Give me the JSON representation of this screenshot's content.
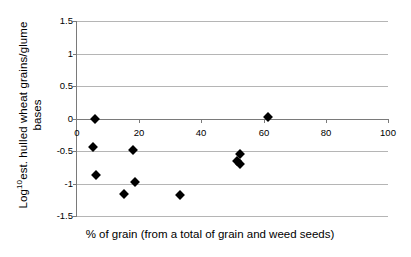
{
  "chart_data": {
    "type": "scatter",
    "title": "",
    "xlabel": "% of grain (from a total of grain and weed seeds)",
    "ylabel_line1": "est. hulled wheat grains/glume",
    "ylabel_line2": "bases",
    "ylabel_prefix": "Log",
    "ylabel_superscript": "10",
    "xlim": [
      0,
      100
    ],
    "ylim": [
      -1.5,
      1.5
    ],
    "xticks": [
      0,
      20,
      40,
      60,
      80,
      100
    ],
    "xtick_labels": [
      "0",
      "20",
      "40",
      "60",
      "80",
      "100"
    ],
    "yticks": [
      1.5,
      1.0,
      0.5,
      0.0,
      -0.5,
      -1.0,
      -1.5
    ],
    "ytick_labels": [
      "1.5",
      "1",
      "0.5",
      "0",
      "-0.5",
      "-1",
      "-1.5"
    ],
    "grid": "horizontal",
    "legend": "none",
    "marker": "filled-diamond",
    "marker_color": "#000000",
    "gridline_color": "#b5b5b5",
    "axis_color": "#7a7a7a",
    "background": "#ffffff",
    "x_axis_position": "at-y-zero",
    "points": [
      {
        "x": 5.8,
        "y": 0.0
      },
      {
        "x": 61.4,
        "y": 0.03
      },
      {
        "x": 5.1,
        "y": -0.44
      },
      {
        "x": 18.0,
        "y": -0.49
      },
      {
        "x": 52.5,
        "y": -0.55
      },
      {
        "x": 51.5,
        "y": -0.65
      },
      {
        "x": 52.5,
        "y": -0.7
      },
      {
        "x": 6.0,
        "y": -0.87
      },
      {
        "x": 18.5,
        "y": -0.98
      },
      {
        "x": 15.2,
        "y": -1.16
      },
      {
        "x": 33.2,
        "y": -1.17
      }
    ]
  }
}
